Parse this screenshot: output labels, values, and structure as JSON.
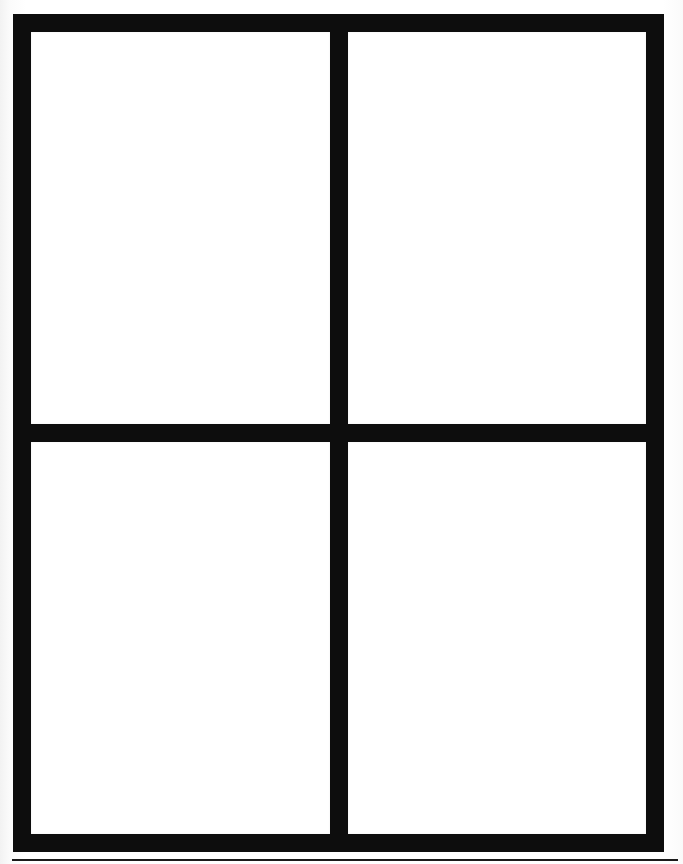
{
  "document": {
    "kind": "scanned-page",
    "page_background_color": "#ffffff",
    "ink_color": "#0d0d0d",
    "panel_fill_color": "#ffffff",
    "frame": {
      "label": "",
      "border_thickness_px": 18,
      "divider_thickness_px": 18,
      "left_px": 13,
      "top_px": 14,
      "width_px": 651,
      "height_px": 838
    },
    "grid": {
      "columns": 2,
      "rows": 2,
      "panels": [
        {
          "id": "panel-top-left",
          "label": "",
          "content": ""
        },
        {
          "id": "panel-top-right",
          "label": "",
          "content": ""
        },
        {
          "id": "panel-bottom-left",
          "label": "",
          "content": ""
        },
        {
          "id": "panel-bottom-right",
          "label": "",
          "content": ""
        }
      ]
    },
    "bottom_rule": {
      "label": "",
      "left_px": 12,
      "top_px": 859,
      "width_px": 666,
      "thickness_px": 2,
      "color": "#1a1a1a"
    }
  }
}
